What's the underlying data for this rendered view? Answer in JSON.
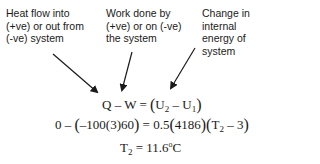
{
  "labels": {
    "heat": "Heat flow into\n(+ve) or out from\n(-ve) system",
    "work": "Work done by\n(+ve) or on (-ve)\nthe system",
    "internal": "Change in\ninternal\nenergy of\nsystem"
  },
  "equations": {
    "eq1": {
      "lhs": "Q – W = ",
      "open": "(",
      "u2": "U",
      "u2_sub": "2",
      "minus": " – ",
      "u1": "U",
      "u1_sub": "1",
      "close": ")"
    },
    "eq2": {
      "part1": "0 – ",
      "open1": "(",
      "part2": "–100",
      "open2": "(",
      "part3": "3",
      "close2": ")",
      "part4": "60",
      "close1": ")",
      "part5": " = 0.5",
      "open3": "(",
      "part6": "4186",
      "close3": ")",
      "open4": "(",
      "t": "T",
      "t_sub": "2",
      "part7": " – 3",
      "close4": ")"
    },
    "eq3": {
      "t": "T",
      "t_sub": "2",
      "value": " = 11.6",
      "deg": "o",
      "unit": "C"
    }
  },
  "arrows": [
    {
      "name": "heat-arrow",
      "x1": 53,
      "y1": 54,
      "x2": 97,
      "y2": 92
    },
    {
      "name": "work-arrow",
      "x1": 132,
      "y1": 52,
      "x2": 122,
      "y2": 90
    },
    {
      "name": "internal-arrow",
      "x1": 195,
      "y1": 48,
      "x2": 171,
      "y2": 88
    }
  ],
  "colors": {
    "text": "#1a1a1a",
    "background": "#ffffff"
  }
}
